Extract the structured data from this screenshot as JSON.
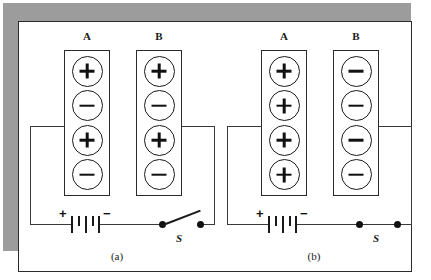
{
  "figure": {
    "caption_a": "(a)",
    "caption_b": "(b)",
    "colors": {
      "shadow": "#9c9c9c",
      "card_background": "#ffffff",
      "line": "#2b2b2b",
      "ink": "#111111"
    }
  },
  "panels": [
    {
      "id": "a",
      "caption": "(a)",
      "switch": {
        "label": "S",
        "state": "open"
      },
      "battery": {
        "positive_sign": "+",
        "negative_sign": "−"
      },
      "plates": [
        {
          "label": "A",
          "charges": [
            "+",
            "−",
            "+",
            "−"
          ]
        },
        {
          "label": "B",
          "charges": [
            "+",
            "−",
            "+",
            "−"
          ]
        }
      ]
    },
    {
      "id": "b",
      "caption": "(b)",
      "switch": {
        "label": "S",
        "state": "closed"
      },
      "battery": {
        "positive_sign": "+",
        "negative_sign": "−"
      },
      "plates": [
        {
          "label": "A",
          "charges": [
            "+",
            "+",
            "+",
            "+"
          ]
        },
        {
          "label": "B",
          "charges": [
            "−",
            "−",
            "−",
            "−"
          ]
        }
      ]
    }
  ]
}
